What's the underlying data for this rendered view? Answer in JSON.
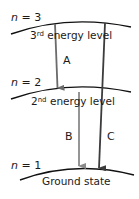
{
  "diagram": {
    "levels": [
      {
        "n_label": "n",
        "n_eq": "=",
        "n_value": "3",
        "ordinal_num": "3",
        "ordinal_suffix": "rd",
        "name": "energy level"
      },
      {
        "n_label": "n",
        "n_eq": "=",
        "n_value": "2",
        "ordinal_num": "2",
        "ordinal_suffix": "nd",
        "name": "energy level"
      },
      {
        "n_label": "n",
        "n_eq": "=",
        "n_value": "1",
        "name": "Ground state"
      }
    ],
    "transitions": [
      {
        "label": "A",
        "from": "n=3",
        "to": "n=2",
        "color": "#6b6b6b"
      },
      {
        "label": "B",
        "from": "n=2",
        "to": "n=1",
        "color": "#8a8a8a"
      },
      {
        "label": "C",
        "from": "n=3",
        "to": "n=1",
        "color": "#3c3c3c"
      }
    ],
    "line_color": "#111111"
  }
}
